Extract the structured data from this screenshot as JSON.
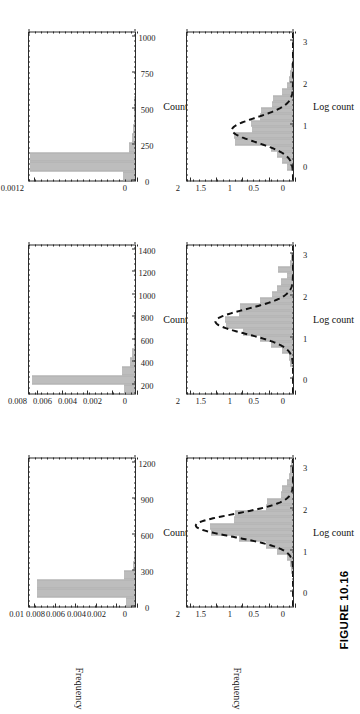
{
  "figure": {
    "caption": "FIGURE 10.16",
    "rotation_note": "figure printed sideways (rotated 90 degrees) on the page"
  },
  "chart_data": [
    {
      "id": "top-left",
      "type": "bar",
      "title": "",
      "xlabel": "Count",
      "ylabel": "Frequency",
      "xlim": [
        0,
        1250
      ],
      "ylim": [
        0,
        0.0105
      ],
      "xticks": [
        0,
        300,
        600,
        900,
        1200
      ],
      "xticklabels": [
        "0",
        "300",
        "600",
        "900",
        "1200"
      ],
      "yticks": [
        0,
        0.002,
        0.004,
        0.006,
        0.008,
        0.01
      ],
      "yticklabels": [
        "0",
        "0.002",
        "0.004",
        "0.006",
        "0.008",
        "0.01"
      ],
      "grid": false,
      "bin_edges": [
        0,
        75,
        150,
        225,
        300,
        375,
        450,
        525,
        600,
        675,
        750,
        825,
        900,
        975,
        1050,
        1125,
        1200
      ],
      "values": [
        0.0009,
        0.0095,
        0.0095,
        0.0011,
        0.00018,
        9e-05,
        5e-05,
        4e-05,
        3e-05,
        2e-05,
        2e-05,
        1e-05,
        1e-05,
        1e-05,
        5e-06,
        5e-06
      ],
      "curve": null
    },
    {
      "id": "top-middle",
      "type": "bar",
      "title": "",
      "xlabel": "Count",
      "ylabel": "",
      "xlim": [
        120,
        1450
      ],
      "ylim": [
        0,
        0.0086
      ],
      "xticks": [
        200,
        400,
        600,
        800,
        1000,
        1200,
        1400
      ],
      "xticklabels": [
        "200",
        "400",
        "600",
        "800",
        "1000",
        "1200",
        "1400"
      ],
      "yticks": [
        0,
        0.002,
        0.004,
        0.006,
        0.008
      ],
      "yticklabels": [
        "0",
        "0.002",
        "0.004",
        "0.006",
        "0.008"
      ],
      "grid": false,
      "bin_edges": [
        120,
        200,
        280,
        360,
        440,
        520,
        600,
        680,
        760,
        840,
        920,
        1000,
        1080,
        1160,
        1240,
        1320,
        1400
      ],
      "values": [
        0.00085,
        0.0082,
        0.00105,
        0.00042,
        0.00024,
        0.00012,
        8e-05,
        6e-05,
        5e-05,
        4e-05,
        3e-05,
        2e-05,
        2e-05,
        1e-05,
        1e-05,
        1e-05
      ],
      "curve": null
    },
    {
      "id": "top-right",
      "type": "bar",
      "title": "",
      "xlabel": "Count",
      "ylabel": "",
      "xlim": [
        0,
        1040
      ],
      "ylim": [
        0,
        0.00126
      ],
      "xticks": [
        0,
        250,
        500,
        750,
        1000
      ],
      "xticklabels": [
        "0",
        "250",
        "500",
        "750",
        "1000"
      ],
      "yticks": [
        0,
        0.003,
        0.006,
        0.009,
        0.0012
      ],
      "yticklabels": [
        "0",
        "0.003",
        "0.006",
        "0.009",
        "0.0012"
      ],
      "grid": false,
      "bin_edges": [
        0,
        65,
        130,
        195,
        260,
        325,
        390,
        455,
        520,
        585,
        650,
        715,
        780,
        845,
        910,
        975,
        1040
      ],
      "values": [
        0.00014,
        0.00122,
        0.00122,
        7e-05,
        3e-05,
        2e-05,
        1e-05,
        1e-05,
        8e-06,
        6e-06,
        5e-06,
        4e-06,
        3e-06,
        3e-06,
        2e-06,
        2e-06
      ],
      "curve": null
    },
    {
      "id": "bottom-left",
      "type": "bar",
      "title": "",
      "xlabel": "Log count",
      "ylabel": "Frequency",
      "xlim": [
        -0.35,
        3.25
      ],
      "ylim": [
        0,
        2.05
      ],
      "xticks": [
        0,
        1,
        2,
        3
      ],
      "xticklabels": [
        "0",
        "1",
        "2",
        "3"
      ],
      "yticks": [
        0,
        0.5,
        1,
        1.5,
        2
      ],
      "yticklabels": [
        "0",
        "0.5",
        "1",
        "1.5",
        "2"
      ],
      "grid": false,
      "bin_edges": [
        0.45,
        0.6,
        0.75,
        0.9,
        1.05,
        1.2,
        1.35,
        1.5,
        1.65,
        1.8,
        1.95,
        2.1,
        2.25,
        2.4,
        2.55,
        2.7,
        2.85,
        3.0,
        3.15
      ],
      "values": [
        0.04,
        0.06,
        0.12,
        0.3,
        0.52,
        1.02,
        1.55,
        1.58,
        1.12,
        1.1,
        0.52,
        0.5,
        0.22,
        0.2,
        0.12,
        0.08,
        0.05,
        0.03
      ],
      "curve": {
        "kind": "normal-fit",
        "style": "dashed",
        "mean": 1.62,
        "sd": 0.28,
        "peak": 1.88
      }
    },
    {
      "id": "bottom-middle",
      "type": "bar",
      "title": "",
      "xlabel": "Log count",
      "ylabel": "",
      "xlim": [
        -0.35,
        3.25
      ],
      "ylim": [
        0,
        2.05
      ],
      "xticks": [
        0,
        1,
        2,
        3
      ],
      "xticklabels": [
        "0",
        "1",
        "2",
        "3"
      ],
      "yticks": [
        0,
        0.5,
        1,
        1.5,
        2
      ],
      "yticklabels": [
        "0",
        "0.5",
        "1",
        "1.5",
        "2"
      ],
      "grid": false,
      "bin_edges": [
        0.3,
        0.45,
        0.6,
        0.75,
        0.9,
        1.05,
        1.2,
        1.35,
        1.5,
        1.65,
        1.8,
        1.95,
        2.1,
        2.25,
        2.4,
        2.55,
        2.7,
        2.85,
        3.0
      ],
      "values": [
        0.05,
        0.08,
        0.2,
        0.42,
        0.62,
        0.95,
        1.28,
        1.3,
        1.02,
        1.0,
        0.62,
        0.4,
        0.3,
        0.22,
        0.12,
        0.28,
        0.06,
        0.03
      ],
      "curve": {
        "kind": "normal-fit",
        "style": "dashed",
        "mean": 1.4,
        "sd": 0.3,
        "peak": 1.5
      }
    },
    {
      "id": "bottom-right",
      "type": "bar",
      "title": "",
      "xlabel": "Log count",
      "ylabel": "",
      "xlim": [
        -0.35,
        3.25
      ],
      "ylim": [
        0,
        2.05
      ],
      "xticks": [
        0,
        1,
        2,
        3
      ],
      "xticklabels": [
        "0",
        "1",
        "2",
        "3"
      ],
      "yticks": [
        0,
        0.5,
        1,
        1.5,
        2
      ],
      "yticklabels": [
        "0",
        "0.5",
        "1",
        "1.5",
        "2"
      ],
      "grid": false,
      "bin_edges": [
        -0.1,
        0.05,
        0.2,
        0.35,
        0.5,
        0.65,
        0.8,
        0.95,
        1.1,
        1.25,
        1.4,
        1.55,
        1.7,
        1.85,
        2.0,
        2.15,
        2.3,
        2.45,
        2.6
      ],
      "values": [
        0.12,
        0.2,
        0.3,
        0.42,
        1.1,
        1.12,
        0.78,
        0.8,
        0.62,
        0.6,
        0.4,
        0.38,
        0.2,
        0.12,
        0.08,
        0.05,
        0.03,
        0.02
      ],
      "curve": {
        "kind": "normal-fit",
        "style": "dashed",
        "mean": 0.88,
        "sd": 0.3,
        "peak": 1.18
      }
    }
  ]
}
